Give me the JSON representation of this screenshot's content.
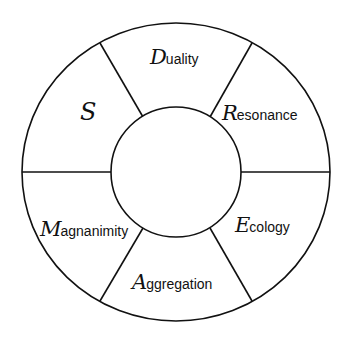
{
  "diagram": {
    "type": "segmented-ring",
    "segment_count": 6,
    "center_label": "",
    "line_color": "#111111",
    "background": "#ffffff",
    "segments": [
      {
        "id": "s",
        "initial": "S",
        "rest": "",
        "full": "S"
      },
      {
        "id": "duality",
        "initial": "D",
        "rest": "uality",
        "full": "Duality"
      },
      {
        "id": "resonance",
        "initial": "R",
        "rest": "esonance",
        "full": "Resonance"
      },
      {
        "id": "ecology",
        "initial": "E",
        "rest": "cology",
        "full": "Ecology"
      },
      {
        "id": "aggregation",
        "initial": "A",
        "rest": "ggregation",
        "full": "Aggregation"
      },
      {
        "id": "magnanimity",
        "initial": "M",
        "rest": "agnanimity",
        "full": "Magnanimity"
      }
    ]
  }
}
